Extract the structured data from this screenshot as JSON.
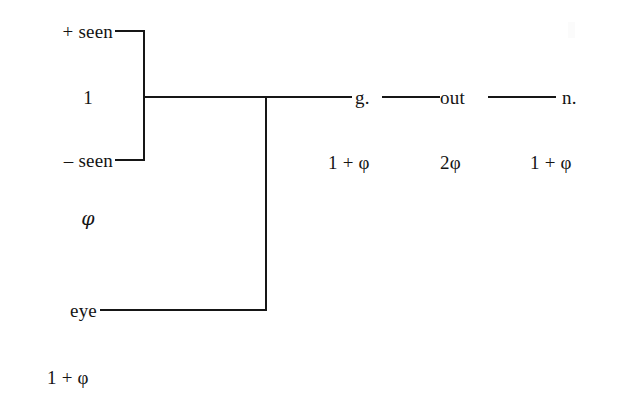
{
  "diagram": {
    "type": "feature-tree",
    "background_color": "#ffffff",
    "line_color": "#161616",
    "text_color": "#141414",
    "nodes": {
      "plus_seen": {
        "label": "+ seen",
        "x": 113,
        "y": 31
      },
      "minus_seen": {
        "label": "– seen",
        "x": 113,
        "y": 160
      },
      "bracket_weight": {
        "label": "1",
        "x": 88,
        "y": 97
      },
      "bracket_phi": {
        "label": "φ",
        "x": 88,
        "y": 218
      },
      "eye": {
        "label": "eye",
        "x": 97,
        "y": 310
      },
      "eye_weight": {
        "label": "1 + φ",
        "x": 80,
        "y": 377
      },
      "g": {
        "label": "g.",
        "x": 355,
        "y": 97
      },
      "out": {
        "label": "out",
        "x": 440,
        "y": 97
      },
      "n": {
        "label": "n.",
        "x": 562,
        "y": 97
      }
    },
    "weights": [
      {
        "label": "1 + φ",
        "x": 328,
        "y": 162,
        "for": "g."
      },
      {
        "label": "2φ",
        "x": 440,
        "y": 162,
        "for": "out"
      },
      {
        "label": "1 + φ",
        "x": 530,
        "y": 162,
        "for": "n."
      }
    ],
    "edges": [
      {
        "name": "plus-seen-connector",
        "orient": "h",
        "x": 115,
        "y": 31,
        "length": 28
      },
      {
        "name": "minus-seen-connector",
        "orient": "h",
        "x": 115,
        "y": 160,
        "length": 28
      },
      {
        "name": "bracket-spine",
        "orient": "v",
        "x": 143,
        "y": 31,
        "length": 129
      },
      {
        "name": "bracket-stem",
        "orient": "h",
        "x": 143,
        "y": 97,
        "length": 209
      },
      {
        "name": "eye-riser",
        "orient": "v",
        "x": 266,
        "y": 97,
        "length": 213
      },
      {
        "name": "eye-connector",
        "orient": "h",
        "x": 100,
        "y": 310,
        "length": 166
      },
      {
        "name": "g-to-out-connector",
        "orient": "h",
        "x": 382,
        "y": 97,
        "length": 58
      },
      {
        "name": "out-to-n-connector",
        "orient": "h",
        "x": 488,
        "y": 97,
        "length": 68
      }
    ]
  }
}
